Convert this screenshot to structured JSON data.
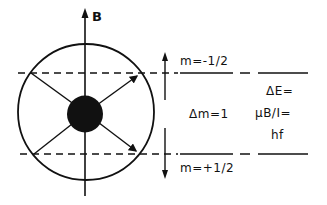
{
  "diagram": {
    "type": "spin-precession-energy-level",
    "field_label": "B",
    "levels": {
      "upper": "m=-1/2",
      "lower": "m=+1/2"
    },
    "transition_label": "Δm=1",
    "energy_equation": {
      "line1": "ΔE=",
      "line2": "μB/I=",
      "line3": "hf"
    },
    "colors": {
      "ink": "#111111",
      "background": "#ffffff"
    }
  }
}
